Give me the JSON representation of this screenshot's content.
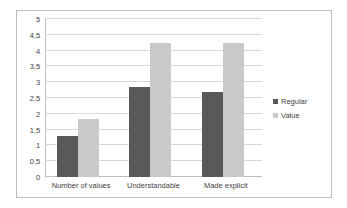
{
  "chart_data": {
    "type": "bar",
    "title": "",
    "xlabel": "",
    "ylabel": "",
    "ylim": [
      0,
      5
    ],
    "grid": true,
    "legend_position": "right",
    "categories": [
      "Number of values",
      "Understandable",
      "Made explicit"
    ],
    "ytick_labels": [
      "5",
      "4,5",
      "4",
      "3,5",
      "3",
      "2,5",
      "2",
      "1,5",
      "1",
      "0,5",
      "0"
    ],
    "ytick_values": [
      5,
      4.5,
      4,
      3.5,
      3,
      2.5,
      2,
      1.5,
      1,
      0.5,
      0
    ],
    "series": [
      {
        "name": "Regular",
        "color": "#595959",
        "values": [
          1.3,
          2.85,
          2.7
        ]
      },
      {
        "name": "Value",
        "color": "#c9c9c9",
        "values": [
          1.85,
          4.25,
          4.25
        ]
      }
    ]
  },
  "figure": {
    "border_color": "#b9bcc0",
    "background": "#ffffff",
    "gridline_color": "#d6d8da",
    "axis_color": "#bcbec1"
  }
}
